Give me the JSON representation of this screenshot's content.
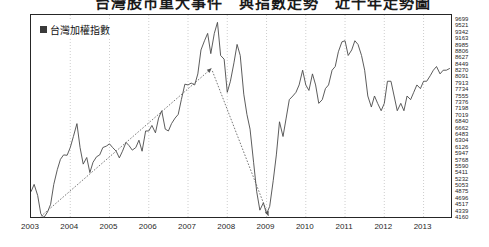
{
  "title": "台灣股市重大事件　與指數走勢　近十年走勢圖",
  "legend": {
    "swatch_color": "#3a3a3a",
    "label": "台灣加權指數"
  },
  "axis": {
    "line_color": "#262626",
    "grid_color": "#b9b9b9",
    "series_color": "#4a4a4a",
    "trend_color": "#555555"
  },
  "chart_data": {
    "type": "line",
    "title": "台灣股市重大事件　與指數走勢　近十年走勢圖",
    "xlabel": "",
    "ylabel": "",
    "grid": true,
    "legend_position": "top-left",
    "xlim": [
      2003.0,
      2013.75
    ],
    "ylim": [
      4160,
      9699
    ],
    "xticks": [
      "2003",
      "2004",
      "2005",
      "2006",
      "2007",
      "2008",
      "2009",
      "2010",
      "2011",
      "2012",
      "2013"
    ],
    "yticks": [
      9699,
      9521,
      9342,
      9163,
      8985,
      8806,
      8627,
      8449,
      8270,
      8091,
      7913,
      7734,
      7555,
      7376,
      7198,
      7019,
      6840,
      6662,
      6483,
      6304,
      6126,
      5947,
      5768,
      5590,
      5411,
      5232,
      5053,
      4875,
      4696,
      4517,
      4339,
      4160
    ],
    "series": [
      {
        "name": "台灣加權指數",
        "x": [
          2003.0,
          2003.08,
          2003.17,
          2003.25,
          2003.33,
          2003.42,
          2003.5,
          2003.58,
          2003.67,
          2003.75,
          2003.83,
          2003.92,
          2004.0,
          2004.08,
          2004.17,
          2004.25,
          2004.33,
          2004.42,
          2004.5,
          2004.58,
          2004.67,
          2004.75,
          2004.83,
          2004.92,
          2005.0,
          2005.08,
          2005.17,
          2005.25,
          2005.33,
          2005.42,
          2005.5,
          2005.58,
          2005.67,
          2005.75,
          2005.83,
          2005.92,
          2006.0,
          2006.08,
          2006.17,
          2006.25,
          2006.33,
          2006.42,
          2006.5,
          2006.58,
          2006.67,
          2006.75,
          2006.83,
          2006.92,
          2007.0,
          2007.08,
          2007.17,
          2007.25,
          2007.33,
          2007.42,
          2007.5,
          2007.58,
          2007.67,
          2007.75,
          2007.83,
          2007.92,
          2008.0,
          2008.08,
          2008.17,
          2008.25,
          2008.33,
          2008.42,
          2008.5,
          2008.58,
          2008.67,
          2008.75,
          2008.83,
          2008.92,
          2009.0,
          2009.08,
          2009.17,
          2009.25,
          2009.33,
          2009.42,
          2009.5,
          2009.58,
          2009.67,
          2009.75,
          2009.83,
          2009.92,
          2010.0,
          2010.08,
          2010.17,
          2010.25,
          2010.33,
          2010.42,
          2010.5,
          2010.58,
          2010.67,
          2010.75,
          2010.83,
          2010.92,
          2011.0,
          2011.08,
          2011.17,
          2011.25,
          2011.33,
          2011.42,
          2011.5,
          2011.58,
          2011.67,
          2011.75,
          2011.83,
          2011.92,
          2012.0,
          2012.08,
          2012.17,
          2012.25,
          2012.33,
          2012.42,
          2012.5,
          2012.58,
          2012.67,
          2012.75,
          2012.83,
          2012.92,
          2013.0,
          2013.08,
          2013.17,
          2013.25,
          2013.33,
          2013.42,
          2013.5,
          2013.58,
          2013.67
        ],
        "values": [
          4900,
          5100,
          4800,
          4300,
          4200,
          4350,
          4560,
          5100,
          5500,
          5780,
          5900,
          5890,
          6100,
          6400,
          6750,
          6100,
          5650,
          5830,
          5420,
          5700,
          5850,
          5900,
          6100,
          6140,
          6200,
          6100,
          6000,
          5820,
          6000,
          6240,
          6150,
          6030,
          6100,
          6300,
          6000,
          6550,
          6550,
          6700,
          6500,
          6900,
          7100,
          6600,
          6550,
          6750,
          6900,
          7000,
          7400,
          7820,
          7800,
          7850,
          7800,
          8100,
          8750,
          9000,
          9200,
          8650,
          9200,
          9500,
          8600,
          8500,
          7600,
          7900,
          8400,
          8900,
          8600,
          7550,
          7000,
          6600,
          5700,
          4900,
          4400,
          4600,
          4300,
          4500,
          5200,
          5900,
          6800,
          6400,
          6900,
          7400,
          7500,
          7600,
          7800,
          8200,
          7800,
          7650,
          8100,
          7800,
          7300,
          7400,
          7700,
          7800,
          8200,
          8300,
          8700,
          8970,
          9000,
          8600,
          8750,
          9000,
          8900,
          8600,
          8200,
          7500,
          7200,
          7500,
          7300,
          7100,
          7300,
          7900,
          7900,
          7500,
          7100,
          7300,
          7100,
          7500,
          7400,
          7600,
          7800,
          7700,
          7900,
          7900,
          8050,
          8200,
          8300,
          8100,
          8200,
          8200,
          8250
        ]
      }
    ],
    "annotations": [
      {
        "name": "uptrend-arrow",
        "style": "dotted-arrow",
        "from": {
          "x": 2003.25,
          "y": 4230
        },
        "to": {
          "x": 2007.6,
          "y": 8250
        }
      },
      {
        "name": "downtrend-arrow",
        "style": "dotted-arrow",
        "from": {
          "x": 2007.62,
          "y": 8180
        },
        "to": {
          "x": 2009.05,
          "y": 4240
        }
      }
    ]
  }
}
